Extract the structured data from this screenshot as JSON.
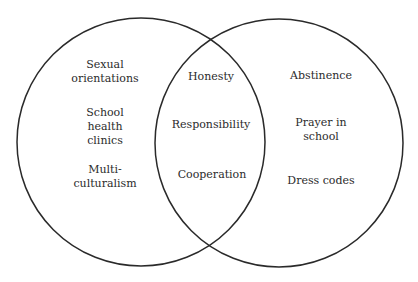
{
  "diagram": {
    "type": "venn",
    "circles": [
      {
        "id": "left",
        "cx": 141,
        "cy": 142,
        "r": 124,
        "stroke": "#2a2a2a"
      },
      {
        "id": "right",
        "cx": 279,
        "cy": 143,
        "r": 124,
        "stroke": "#2a2a2a"
      }
    ],
    "left_only": {
      "items": [
        {
          "lines": [
            "Sexual",
            "orientations"
          ]
        },
        {
          "lines": [
            "School",
            "health",
            "clinics"
          ]
        },
        {
          "lines": [
            "Multi-",
            "culturalism"
          ]
        }
      ]
    },
    "intersection": {
      "items": [
        {
          "lines": [
            "Honesty"
          ]
        },
        {
          "lines": [
            "Responsibility"
          ]
        },
        {
          "lines": [
            "Cooperation"
          ]
        }
      ]
    },
    "right_only": {
      "items": [
        {
          "lines": [
            "Abstinence"
          ]
        },
        {
          "lines": [
            "Prayer in",
            "school"
          ]
        },
        {
          "lines": [
            "Dress codes"
          ]
        }
      ]
    },
    "text_color": "#2b2b2b",
    "background": "#ffffff"
  }
}
